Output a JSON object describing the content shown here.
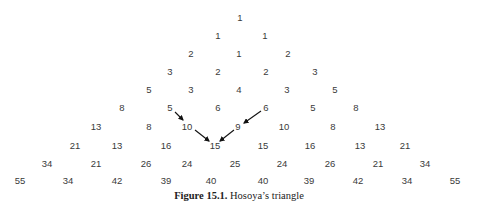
{
  "figure": {
    "caption": {
      "label": "Figure 15.1.",
      "text": "Hosoya’s triangle"
    },
    "rows": [
      {
        "y": 18,
        "values": [
          1
        ],
        "x": [
          240
        ]
      },
      {
        "y": 36,
        "values": [
          1,
          1
        ],
        "x": [
          218,
          265
        ]
      },
      {
        "y": 54,
        "values": [
          2,
          1,
          2
        ],
        "x": [
          191,
          239,
          288
        ]
      },
      {
        "y": 72,
        "values": [
          3,
          2,
          2,
          3
        ],
        "x": [
          170,
          218,
          266,
          315
        ]
      },
      {
        "y": 90,
        "values": [
          5,
          3,
          4,
          3,
          5
        ],
        "x": [
          149,
          191,
          239,
          287,
          335
        ]
      },
      {
        "y": 108,
        "values": [
          8,
          5,
          6,
          6,
          5,
          8
        ],
        "x": [
          122,
          170,
          218,
          266,
          313,
          356
        ]
      },
      {
        "y": 127,
        "values": [
          13,
          8,
          10,
          9,
          10,
          8,
          13
        ],
        "x": [
          96,
          149,
          187,
          238,
          284,
          333,
          380
        ]
      },
      {
        "y": 146,
        "values": [
          21,
          13,
          16,
          15,
          15,
          16,
          13,
          21
        ],
        "x": [
          75,
          117,
          166,
          215,
          263,
          310,
          360,
          405
        ]
      },
      {
        "y": 164,
        "values": [
          34,
          21,
          26,
          24,
          25,
          24,
          26,
          21,
          34
        ],
        "x": [
          47,
          96,
          146,
          187,
          235,
          282,
          330,
          378,
          425
        ]
      },
      {
        "y": 181,
        "values": [
          55,
          34,
          42,
          39,
          40,
          40,
          39,
          42,
          34,
          55
        ],
        "x": [
          20,
          68,
          117,
          166,
          211,
          263,
          309,
          358,
          407,
          455
        ]
      }
    ],
    "arrows": [
      {
        "from": "5 (row 5)",
        "to": "10 (row 6)",
        "x1": 175,
        "y1": 112,
        "x2": 183,
        "y2": 120
      },
      {
        "from": "10 (row 6)",
        "to": "15 (row 7)",
        "x1": 195,
        "y1": 130,
        "x2": 209,
        "y2": 141
      },
      {
        "from": "6 (row 5)",
        "to": "9 (row 6)",
        "x1": 261,
        "y1": 111,
        "x2": 244,
        "y2": 123
      },
      {
        "from": "9 (row 6)",
        "to": "15 (row 7)",
        "x1": 234,
        "y1": 130,
        "x2": 220,
        "y2": 141
      }
    ],
    "colors": {
      "text": "#3a3a3a",
      "arrow": "#111111",
      "caption": "#222222",
      "background": "#ffffff"
    }
  }
}
